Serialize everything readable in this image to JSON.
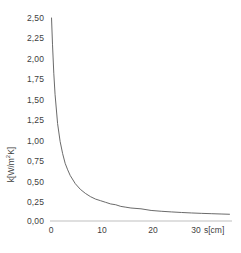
{
  "chart_data": {
    "type": "line",
    "title": "",
    "subtitle": "",
    "xlabel": "s[cm]",
    "ylabel": "k[W/m²K]",
    "ylabel_base": "k[W/m",
    "ylabel_exp": "2",
    "ylabel_tail": "K]",
    "xlim": [
      0,
      36
    ],
    "ylim": [
      0,
      2.5
    ],
    "grid": false,
    "legend": false,
    "legend_position": "none",
    "decimal_separator": ",",
    "x_ticks": [
      0,
      10,
      20,
      30
    ],
    "x_tick_labels": [
      "0",
      "10",
      "20",
      "30"
    ],
    "y_ticks": [
      0,
      0.25,
      0.5,
      0.75,
      1.0,
      1.25,
      1.5,
      1.75,
      2.0,
      2.25,
      2.5
    ],
    "y_tick_labels": [
      "0,00",
      "0,25",
      "0,50",
      "0,75",
      "1,00",
      "1,25",
      "1,50",
      "1,75",
      "2,00",
      "2,25",
      "2,50"
    ],
    "series": [
      {
        "name": "k",
        "color": "#595959",
        "x": [
          0.3,
          0.5,
          0.75,
          1.0,
          1.5,
          2.0,
          2.5,
          3.0,
          3.5,
          4.0,
          5.0,
          6.0,
          7.0,
          8.0,
          9.0,
          10.0,
          11.0,
          12.0,
          13.0,
          14.0,
          15.0,
          16.0,
          18.0,
          20.0,
          22.0,
          24.0,
          26.0,
          28.0,
          30.0,
          32.0,
          34.0,
          35.5
        ],
        "y": [
          2.5,
          2.17,
          1.82,
          1.56,
          1.2,
          0.98,
          0.83,
          0.71,
          0.63,
          0.56,
          0.46,
          0.39,
          0.34,
          0.3,
          0.27,
          0.25,
          0.23,
          0.21,
          0.2,
          0.18,
          0.17,
          0.16,
          0.15,
          0.13,
          0.12,
          0.112,
          0.105,
          0.099,
          0.094,
          0.09,
          0.086,
          0.083
        ]
      }
    ],
    "axis_color": "#bfbfbf",
    "text_color": "#404040",
    "background": "#ffffff"
  },
  "plot_geometry": {
    "left": 50,
    "right": 232,
    "top": 18,
    "bottom": 221
  }
}
